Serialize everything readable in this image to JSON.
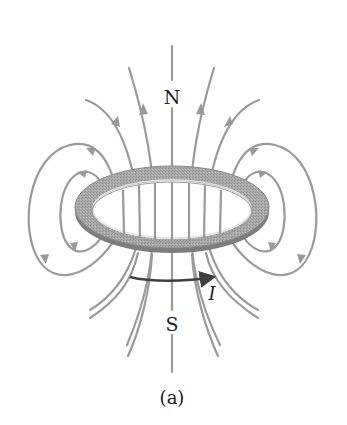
{
  "figure": {
    "pole_north_label": "N",
    "pole_south_label": "S",
    "current_label": "I",
    "caption": "(a)",
    "colors": {
      "field_line": "#9a9a9a",
      "ring_top": "#a8a8a8",
      "ring_edge": "#7d7d7d",
      "ring_highlight": "#e2e2e2",
      "current_arrow": "#3f3f3f",
      "text": "#222222"
    }
  }
}
